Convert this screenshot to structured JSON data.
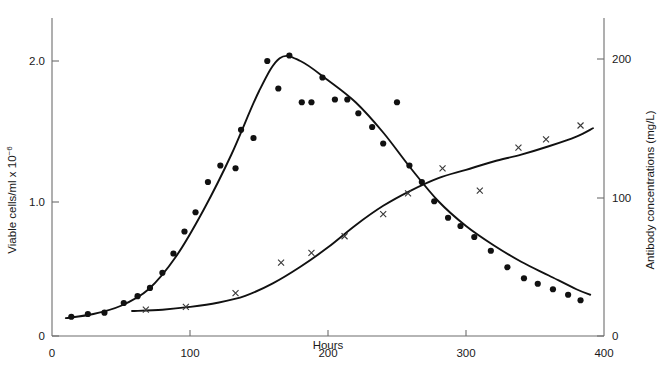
{
  "chart_data": {
    "type": "scatter",
    "title": "",
    "subtitle": "",
    "xlabel": "Hours",
    "ylabel": "Viable cells/ml x 10",
    "ylabel_exponent": "−6",
    "y2label": "Antibody concentrations (mg/L)",
    "xlim": [
      0,
      400
    ],
    "ylim": [
      0,
      2.4
    ],
    "y2lim": [
      0,
      215
    ],
    "xticks": [
      0,
      100,
      200,
      300,
      400
    ],
    "xticklabels": [
      "0",
      "100",
      "200",
      "300",
      "400"
    ],
    "yticks": [
      0,
      1.0,
      2.0
    ],
    "yticklabels": [
      "0",
      "1.0",
      "2.0"
    ],
    "y2ticks": [
      0,
      100,
      200
    ],
    "y2ticklabels": [
      "0",
      "100",
      "200"
    ],
    "grid": false,
    "legend": "none",
    "series": [
      {
        "name": "Viable cells/ml x 10^-6",
        "axis": "left",
        "marker": "filled-circle",
        "has_fit_curve": true,
        "x": [
          14,
          26,
          38,
          52,
          62,
          71,
          80,
          88,
          96,
          104,
          113,
          122,
          133,
          137,
          146,
          156,
          164,
          172,
          181,
          188,
          196,
          205,
          214,
          222,
          232,
          240,
          250,
          259,
          268,
          277,
          287,
          296,
          306,
          318,
          330,
          342,
          352,
          363,
          374,
          383
        ],
        "y": [
          0.14,
          0.16,
          0.17,
          0.24,
          0.29,
          0.35,
          0.46,
          0.6,
          0.76,
          0.9,
          1.12,
          1.24,
          1.22,
          1.5,
          1.44,
          2.0,
          1.8,
          2.04,
          1.7,
          1.7,
          1.88,
          1.72,
          1.72,
          1.62,
          1.52,
          1.4,
          1.7,
          1.24,
          1.12,
          0.98,
          0.86,
          0.8,
          0.72,
          0.62,
          0.5,
          0.42,
          0.38,
          0.34,
          0.3,
          0.26
        ],
        "fit_x": [
          10,
          30,
          50,
          70,
          90,
          110,
          130,
          150,
          165,
          180,
          200,
          220,
          240,
          260,
          280,
          300,
          320,
          340,
          360,
          380,
          390
        ],
        "fit_y": [
          0.13,
          0.16,
          0.22,
          0.34,
          0.58,
          0.92,
          1.32,
          1.78,
          2.02,
          2.0,
          1.86,
          1.7,
          1.48,
          1.22,
          0.98,
          0.8,
          0.66,
          0.54,
          0.44,
          0.34,
          0.3
        ]
      },
      {
        "name": "Antibody concentrations (mg/L)",
        "axis": "right",
        "marker": "cross",
        "has_fit_curve": true,
        "x": [
          68,
          97,
          133,
          166,
          188,
          212,
          240,
          258,
          283,
          310,
          338,
          358,
          383
        ],
        "y": [
          19,
          21,
          31,
          53,
          60,
          72,
          88,
          103,
          121,
          105,
          136,
          142,
          152
        ],
        "fit_x": [
          58,
          80,
          100,
          120,
          140,
          160,
          180,
          200,
          220,
          240,
          260,
          280,
          300,
          320,
          340,
          360,
          380,
          392
        ],
        "fit_y": [
          18,
          19,
          21,
          24,
          29,
          38,
          50,
          64,
          80,
          94,
          105,
          114,
          120,
          126,
          131,
          137,
          144,
          150
        ]
      }
    ]
  },
  "axes": {
    "left_title_main": "Viable cells/ml x 10",
    "left_title_exp": "−6",
    "right_title": "Antibody concentrations (mg/L)",
    "bottom_title": "Hours",
    "x_tick_0": "0",
    "x_tick_1": "100",
    "x_tick_2": "200",
    "x_tick_3": "300",
    "x_tick_4": "400",
    "y_tick_0": "0",
    "y_tick_1": "1.0",
    "y_tick_2": "2.0",
    "y2_tick_0": "0",
    "y2_tick_1": "100",
    "y2_tick_2": "200",
    "origin_label": "0"
  },
  "colors": {
    "axis": "#6d6d6d",
    "curve": "#111111",
    "circle_marker": "#111111",
    "cross_marker": "#3b3b3b",
    "background": "#ffffff",
    "text": "#1a1a1a"
  }
}
